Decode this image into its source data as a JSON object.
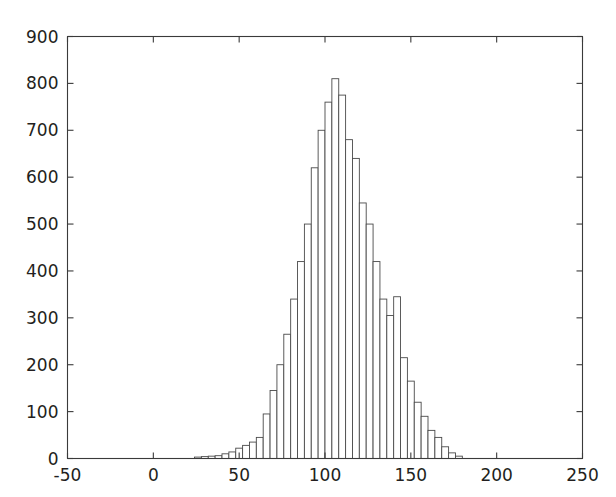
{
  "figure": {
    "background_color": "#ffffff",
    "axis_color": "#3a3a3a",
    "bar_edge_color": "#4a4a4a",
    "bar_fill_color": "#ffffff",
    "text_color": "#231f20"
  },
  "chart_data": {
    "type": "bar",
    "title": "",
    "xlabel": "",
    "ylabel": "",
    "xlim": [
      -50,
      250
    ],
    "ylim": [
      0,
      900
    ],
    "xticks": [
      -50,
      0,
      50,
      100,
      150,
      200,
      250
    ],
    "xtick_labels": [
      "-50",
      "0",
      "50",
      "100",
      "150",
      "200",
      "250"
    ],
    "yticks": [
      0,
      100,
      200,
      300,
      400,
      500,
      600,
      700,
      800,
      900
    ],
    "ytick_labels": [
      "0",
      "100",
      "200",
      "300",
      "400",
      "500",
      "600",
      "700",
      "800",
      "900"
    ],
    "grid": false,
    "legend": null,
    "bin_width": 4,
    "bin_centers": [
      26,
      30,
      34,
      38,
      42,
      46,
      50,
      54,
      58,
      62,
      66,
      70,
      74,
      78,
      82,
      86,
      90,
      94,
      98,
      102,
      106,
      110,
      114,
      118,
      122,
      126,
      130,
      134,
      138,
      142,
      146,
      150,
      154,
      158,
      162,
      166,
      170,
      174,
      178
    ],
    "values": [
      3,
      4,
      5,
      6,
      10,
      14,
      22,
      28,
      35,
      45,
      95,
      145,
      200,
      265,
      340,
      420,
      500,
      620,
      700,
      760,
      810,
      775,
      680,
      640,
      545,
      500,
      420,
      340,
      305,
      345,
      215,
      165,
      120,
      90,
      60,
      45,
      25,
      12,
      5
    ],
    "peak_value": 810,
    "peak_bin_center": 106
  }
}
